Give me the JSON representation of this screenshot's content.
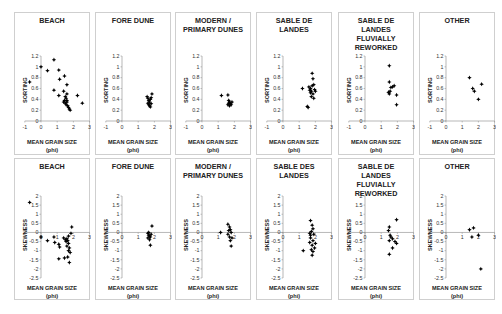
{
  "chart_data": [
    {
      "type": "scatter",
      "title": "BEACH",
      "xlabel": "MEAN GRAIN SIZE (phi)",
      "ylabel": "SORTING",
      "xlim": [
        -1,
        3
      ],
      "ylim": [
        0,
        1.2
      ],
      "xticks": [
        -1,
        0,
        1,
        2,
        3
      ],
      "yticks": [
        0,
        0.2,
        0.4,
        0.6,
        0.8,
        1,
        1.2
      ],
      "points": [
        [
          -0.7,
          0.72
        ],
        [
          0,
          1.0
        ],
        [
          0.4,
          0.93
        ],
        [
          0.8,
          1.13
        ],
        [
          0.8,
          0.57
        ],
        [
          1.1,
          0.94
        ],
        [
          1.15,
          0.77
        ],
        [
          1.45,
          0.83
        ],
        [
          1.1,
          0.47
        ],
        [
          1.6,
          0.67
        ],
        [
          1.4,
          0.55
        ],
        [
          1.6,
          0.5
        ],
        [
          1.5,
          0.45
        ],
        [
          1.45,
          0.38
        ],
        [
          1.55,
          0.42
        ],
        [
          1.4,
          0.35
        ],
        [
          1.5,
          0.33
        ],
        [
          1.55,
          0.3
        ],
        [
          1.6,
          0.35
        ],
        [
          1.65,
          0.28
        ],
        [
          1.7,
          0.25
        ],
        [
          1.75,
          0.22
        ],
        [
          1.8,
          0.2
        ],
        [
          1.6,
          0.38
        ],
        [
          2.25,
          0.47
        ],
        [
          2.55,
          0.33
        ]
      ]
    },
    {
      "type": "scatter",
      "title": "FORE DUNE",
      "xlabel": "MEAN GRAIN SIZE (phi)",
      "ylabel": "SORTING",
      "xlim": [
        -1,
        3
      ],
      "ylim": [
        0,
        1.2
      ],
      "xticks": [
        -1,
        0,
        1,
        2,
        3
      ],
      "yticks": [
        0,
        0.2,
        0.4,
        0.6,
        0.8,
        1,
        1.2
      ],
      "points": [
        [
          1.55,
          0.45
        ],
        [
          1.6,
          0.42
        ],
        [
          1.65,
          0.38
        ],
        [
          1.7,
          0.35
        ],
        [
          1.75,
          0.4
        ],
        [
          1.8,
          0.43
        ],
        [
          1.85,
          0.5
        ],
        [
          1.65,
          0.3
        ],
        [
          1.7,
          0.28
        ],
        [
          1.75,
          0.26
        ],
        [
          1.6,
          0.33
        ],
        [
          1.8,
          0.32
        ]
      ]
    },
    {
      "type": "scatter",
      "title": "MODERN /\nPRIMARY DUNES",
      "xlabel": "MEAN GRAIN SIZE (phi)",
      "ylabel": "SORTING",
      "xlim": [
        -1,
        3
      ],
      "ylim": [
        0,
        1.2
      ],
      "xticks": [
        -1,
        0,
        1,
        2,
        3
      ],
      "yticks": [
        0,
        0.2,
        0.4,
        0.6,
        0.8,
        1,
        1.2
      ],
      "points": [
        [
          1.2,
          0.47
        ],
        [
          1.6,
          0.48
        ],
        [
          1.65,
          0.38
        ],
        [
          1.7,
          0.35
        ],
        [
          1.75,
          0.32
        ],
        [
          1.8,
          0.3
        ],
        [
          1.6,
          0.3
        ],
        [
          1.7,
          0.28
        ],
        [
          1.85,
          0.35
        ],
        [
          1.65,
          0.33
        ]
      ]
    },
    {
      "type": "scatter",
      "title": "SABLE DE\nLANDES",
      "xlabel": "MEAN GRAIN SIZE (phi)",
      "ylabel": "SORTING",
      "xlim": [
        -1,
        3
      ],
      "ylim": [
        0,
        1.2
      ],
      "xticks": [
        -1,
        0,
        1,
        2,
        3
      ],
      "yticks": [
        0,
        0.2,
        0.4,
        0.6,
        0.8,
        1,
        1.2
      ],
      "points": [
        [
          1.2,
          0.6
        ],
        [
          1.8,
          0.88
        ],
        [
          1.85,
          0.78
        ],
        [
          1.6,
          0.63
        ],
        [
          1.7,
          0.6
        ],
        [
          1.75,
          0.55
        ],
        [
          1.8,
          0.65
        ],
        [
          1.9,
          0.67
        ],
        [
          1.95,
          0.58
        ],
        [
          1.85,
          0.5
        ],
        [
          1.7,
          0.52
        ],
        [
          1.9,
          0.42
        ],
        [
          1.75,
          0.45
        ],
        [
          1.5,
          0.27
        ],
        [
          1.55,
          0.25
        ],
        [
          1.65,
          0.57
        ],
        [
          2.0,
          0.55
        ]
      ]
    },
    {
      "type": "scatter",
      "title": "SABLE DE\nLANDES\nFLUVIALLY\nREWORKED",
      "xlabel": "MEAN GRAIN SIZE (phi)",
      "ylabel": "SORTING",
      "xlim": [
        -1,
        3
      ],
      "ylim": [
        0,
        1.2
      ],
      "xticks": [
        -1,
        0,
        1,
        2,
        3
      ],
      "yticks": [
        0,
        0.2,
        0.4,
        0.6,
        0.8,
        1,
        1.2
      ],
      "points": [
        [
          1.5,
          1.02
        ],
        [
          1.5,
          0.72
        ],
        [
          1.6,
          0.62
        ],
        [
          1.7,
          0.63
        ],
        [
          1.8,
          0.65
        ],
        [
          1.45,
          0.53
        ],
        [
          1.55,
          0.55
        ],
        [
          1.5,
          0.5
        ],
        [
          1.95,
          0.48
        ],
        [
          1.95,
          0.3
        ]
      ]
    },
    {
      "type": "scatter",
      "title": "OTHER",
      "xlabel": "MEAN GRAIN SIZE (phi)",
      "ylabel": "SORTING",
      "xlim": [
        -1,
        3
      ],
      "ylim": [
        0,
        1.2
      ],
      "xticks": [
        -1,
        0,
        1,
        2,
        3
      ],
      "yticks": [
        0,
        0.2,
        0.4,
        0.6,
        0.8,
        1,
        1.2
      ],
      "points": [
        [
          1.45,
          0.8
        ],
        [
          1.65,
          0.6
        ],
        [
          1.75,
          0.55
        ],
        [
          2.0,
          0.4
        ],
        [
          2.2,
          0.68
        ]
      ]
    },
    {
      "type": "scatter",
      "title": "BEACH",
      "xlabel": "MEAN GRAIN SIZE (phi)",
      "ylabel": "SKEWNESS",
      "xlim": [
        -1,
        3
      ],
      "ylim": [
        -2.5,
        2
      ],
      "xticks": [
        0,
        1,
        2,
        3
      ],
      "yticks": [
        -2.5,
        -2,
        -1.5,
        -1,
        -0.5,
        0,
        0.5,
        1,
        1.5,
        2
      ],
      "points": [
        [
          -0.7,
          1.65
        ],
        [
          0,
          -0.25
        ],
        [
          0.4,
          -0.45
        ],
        [
          0.8,
          -0.25
        ],
        [
          0.85,
          -0.55
        ],
        [
          1.1,
          -0.65
        ],
        [
          1.15,
          -0.8
        ],
        [
          1.4,
          -0.3
        ],
        [
          1.5,
          -0.4
        ],
        [
          1.55,
          -0.5
        ],
        [
          1.6,
          -0.35
        ],
        [
          1.65,
          -0.45
        ],
        [
          1.7,
          -0.6
        ],
        [
          1.6,
          -0.75
        ],
        [
          1.7,
          -1.0
        ],
        [
          1.75,
          -0.85
        ],
        [
          1.8,
          -1.1
        ],
        [
          1.65,
          -1.35
        ],
        [
          1.45,
          -1.4
        ],
        [
          1.1,
          -1.45
        ],
        [
          1.75,
          -1.65
        ],
        [
          1.9,
          0.3
        ],
        [
          1.85,
          -0.05
        ],
        [
          1.7,
          -0.2
        ]
      ]
    },
    {
      "type": "scatter",
      "title": "FORE DUNE",
      "xlabel": "MEAN GRAIN SIZE (phi)",
      "ylabel": "SKEWNESS",
      "xlim": [
        -1,
        3
      ],
      "ylim": [
        -2.5,
        2
      ],
      "xticks": [
        0,
        1,
        2,
        3
      ],
      "yticks": [
        -2.5,
        -2,
        -1.5,
        -1,
        -0.5,
        0,
        0.5,
        1,
        1.5,
        2
      ],
      "points": [
        [
          1.85,
          0.35
        ],
        [
          1.6,
          -0.05
        ],
        [
          1.65,
          -0.15
        ],
        [
          1.7,
          -0.2
        ],
        [
          1.75,
          -0.25
        ],
        [
          1.8,
          -0.1
        ],
        [
          1.6,
          -0.3
        ],
        [
          1.7,
          -0.4
        ],
        [
          1.75,
          -0.7
        ],
        [
          1.65,
          0.0
        ]
      ]
    },
    {
      "type": "scatter",
      "title": "MODERN /\nPRIMARY DUNES",
      "xlabel": "MEAN GRAIN SIZE (phi)",
      "ylabel": "SKEWNESS",
      "xlim": [
        -1,
        3
      ],
      "ylim": [
        -2.5,
        2
      ],
      "xticks": [
        0,
        1,
        2,
        3
      ],
      "yticks": [
        -2.5,
        -2,
        -1.5,
        -1,
        -0.5,
        0,
        0.5,
        1,
        1.5,
        2
      ],
      "points": [
        [
          1.15,
          0.0
        ],
        [
          1.6,
          0.45
        ],
        [
          1.7,
          0.3
        ],
        [
          1.75,
          0.15
        ],
        [
          1.65,
          0.1
        ],
        [
          1.8,
          0.0
        ],
        [
          1.6,
          -0.1
        ],
        [
          1.7,
          -0.25
        ],
        [
          1.85,
          -0.3
        ],
        [
          1.75,
          -0.45
        ],
        [
          1.8,
          -0.75
        ]
      ]
    },
    {
      "type": "scatter",
      "title": "SABLE DES\nLANDES",
      "xlabel": "MEAN GRAIN SIZE (phi)",
      "ylabel": "SKEWNESS",
      "xlim": [
        -1,
        3
      ],
      "ylim": [
        -2.5,
        2
      ],
      "xticks": [
        0,
        1,
        2,
        3
      ],
      "yticks": [
        -2.5,
        -2,
        -1.5,
        -1,
        -0.5,
        0,
        0.5,
        1,
        1.5,
        2
      ],
      "points": [
        [
          1.7,
          0.65
        ],
        [
          1.8,
          0.4
        ],
        [
          1.85,
          0.2
        ],
        [
          1.75,
          0.05
        ],
        [
          1.65,
          -0.05
        ],
        [
          1.9,
          -0.1
        ],
        [
          1.7,
          -0.3
        ],
        [
          1.85,
          -0.45
        ],
        [
          1.65,
          -0.55
        ],
        [
          1.8,
          -0.7
        ],
        [
          1.95,
          -0.85
        ],
        [
          1.75,
          -0.95
        ],
        [
          1.85,
          -1.05
        ],
        [
          1.25,
          -1.0
        ],
        [
          1.8,
          -1.25
        ],
        [
          2.0,
          -0.6
        ],
        [
          1.7,
          -0.15
        ]
      ]
    },
    {
      "type": "scatter",
      "title": "SABLE DE\nLANDES\nFLUVIALLY\nREWORKED",
      "xlabel": "MEAN GRAIN SIZE (phi)",
      "ylabel": "SKEWNESS",
      "xlim": [
        -1,
        3
      ],
      "ylim": [
        -2.5,
        2
      ],
      "xticks": [
        0,
        1,
        2,
        3
      ],
      "yticks": [
        -2.5,
        -2,
        -1.5,
        -1,
        -0.5,
        0,
        0.5,
        1,
        1.5,
        2
      ],
      "points": [
        [
          1.95,
          0.7
        ],
        [
          1.5,
          0.3
        ],
        [
          1.45,
          0.1
        ],
        [
          1.55,
          -0.15
        ],
        [
          1.6,
          -0.25
        ],
        [
          1.7,
          -0.35
        ],
        [
          1.5,
          -0.45
        ],
        [
          1.85,
          -0.5
        ],
        [
          1.95,
          -0.6
        ],
        [
          1.7,
          -0.85
        ],
        [
          1.5,
          -1.2
        ]
      ]
    },
    {
      "type": "scatter",
      "title": "OTHER",
      "xlabel": "MEAN GRAIN SIZE (phi)",
      "ylabel": "SKEWNESS",
      "xlim": [
        -1,
        3
      ],
      "ylim": [
        -2.5,
        2
      ],
      "xticks": [
        0,
        1,
        2,
        3
      ],
      "yticks": [
        -2.5,
        -2,
        -1.5,
        -1,
        -0.5,
        0,
        0.5,
        1,
        1.5,
        2
      ],
      "points": [
        [
          1.45,
          0.15
        ],
        [
          1.7,
          0.25
        ],
        [
          1.6,
          -0.25
        ],
        [
          2.0,
          -0.15
        ],
        [
          2.15,
          -2.0
        ]
      ]
    }
  ],
  "labels": {
    "x_line1": "MEAN GRAIN SIZE",
    "x_line2": "(phi)",
    "y_sorting": "SORTING",
    "y_skewness": "SKEWNESS"
  },
  "colors": {
    "marker": "#000000",
    "axis": "#888888",
    "border": "#cfcfcf",
    "text": "#222222"
  }
}
